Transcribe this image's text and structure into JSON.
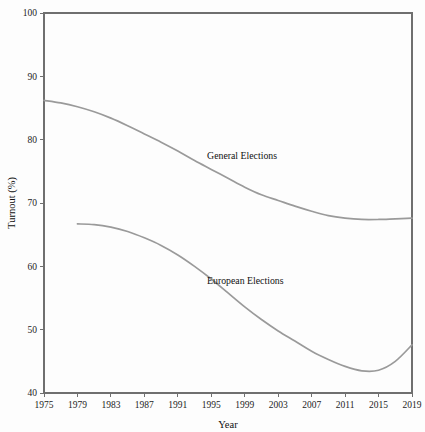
{
  "chart_data": {
    "type": "line",
    "title": "",
    "xlabel": "Year",
    "ylabel": "Turnout (%)",
    "xlim": [
      1975,
      2019
    ],
    "ylim": [
      40,
      100
    ],
    "grid": false,
    "legend_position": "inline-annotation",
    "xticks": [
      "1975",
      "1979",
      "1983",
      "1987",
      "1991",
      "1995",
      "1999",
      "2003",
      "2007",
      "2011",
      "2015",
      "2019"
    ],
    "yticks": [
      "40",
      "50",
      "60",
      "70",
      "80",
      "90",
      "100"
    ],
    "series": [
      {
        "name": "General Elections",
        "color": "#9a9a9a",
        "label_x": 1994.5,
        "label_y": 77.0,
        "x": [
          1975,
          1977,
          1979,
          1981,
          1983,
          1985,
          1987,
          1989,
          1991,
          1993,
          1995,
          1997,
          1999,
          2001,
          2003,
          2005,
          2007,
          2009,
          2011,
          2013,
          2015,
          2017,
          2019
        ],
        "values": [
          86.2,
          85.8,
          85.2,
          84.4,
          83.4,
          82.2,
          80.9,
          79.6,
          78.2,
          76.7,
          75.3,
          73.9,
          72.5,
          71.3,
          70.4,
          69.5,
          68.7,
          68.0,
          67.6,
          67.4,
          67.4,
          67.5,
          67.6
        ]
      },
      {
        "name": "European Elections",
        "color": "#9a9a9a",
        "label_x": 1994.5,
        "label_y": 57.2,
        "x": [
          1979,
          1981,
          1983,
          1985,
          1987,
          1989,
          1991,
          1993,
          1995,
          1997,
          1999,
          2001,
          2003,
          2005,
          2007,
          2009,
          2011,
          2013,
          2015,
          2017,
          2019
        ],
        "values": [
          66.7,
          66.6,
          66.2,
          65.5,
          64.5,
          63.3,
          61.8,
          60.0,
          58.0,
          55.8,
          53.6,
          51.6,
          49.8,
          48.2,
          46.6,
          45.3,
          44.2,
          43.5,
          43.6,
          45.0,
          47.6
        ]
      }
    ]
  },
  "geometry": {
    "plot_left": 44,
    "plot_right": 412,
    "plot_top": 13,
    "plot_bottom": 393
  }
}
